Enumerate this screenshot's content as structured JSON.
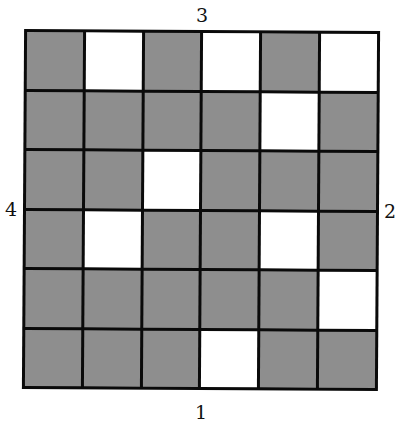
{
  "labels": {
    "top": "3",
    "right": "2",
    "bottom": "1",
    "left": "4"
  },
  "grid": {
    "rows": 6,
    "cols": 6,
    "colors": {
      "shaded": "#8e8e8e",
      "white": "#ffffff",
      "border": "#0a0a0a"
    },
    "cells": [
      [
        "G",
        "W",
        "G",
        "W",
        "G",
        "W"
      ],
      [
        "G",
        "G",
        "G",
        "G",
        "W",
        "G"
      ],
      [
        "G",
        "G",
        "W",
        "G",
        "G",
        "G"
      ],
      [
        "G",
        "W",
        "G",
        "G",
        "W",
        "G"
      ],
      [
        "G",
        "G",
        "G",
        "G",
        "G",
        "W"
      ],
      [
        "G",
        "G",
        "G",
        "W",
        "G",
        "G"
      ]
    ]
  }
}
